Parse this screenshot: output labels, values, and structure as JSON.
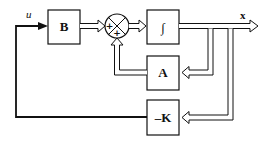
{
  "diagram": {
    "blocks": [
      {
        "id": "B",
        "label": "B"
      },
      {
        "id": "integrator",
        "label": "∫"
      },
      {
        "id": "A",
        "label": "A"
      },
      {
        "id": "K",
        "label": "–K"
      }
    ],
    "summing_junction": {
      "signs": [
        "+",
        "+"
      ]
    },
    "signals": {
      "input": "u",
      "state": "x"
    },
    "colors": {
      "stroke": "#111111",
      "background": "#ffffff"
    }
  }
}
